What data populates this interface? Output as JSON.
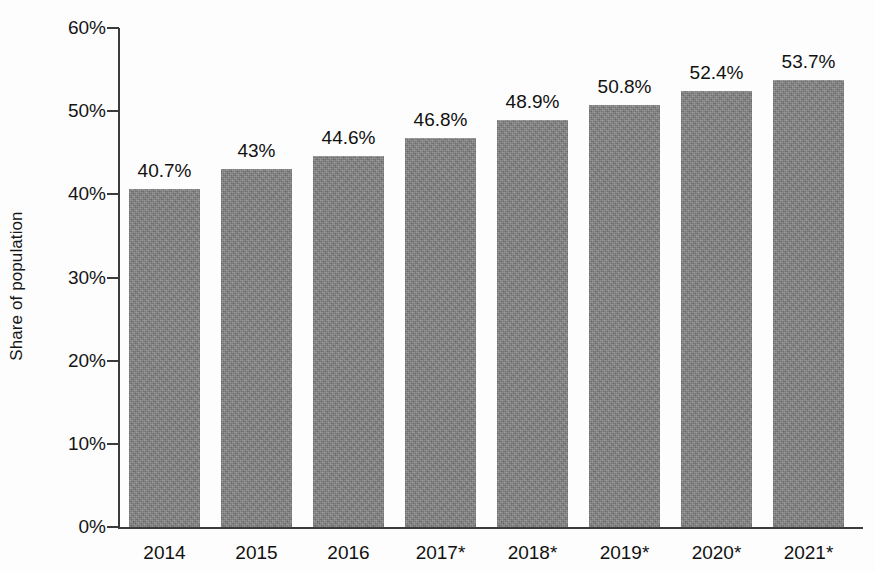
{
  "chart_data": {
    "type": "bar",
    "title": "",
    "subtitle": "",
    "xlabel": "",
    "ylabel": "Share of population",
    "categories": [
      "2014",
      "2015",
      "2016",
      "2017*",
      "2018*",
      "2019*",
      "2020*",
      "2021*"
    ],
    "values": [
      40.7,
      43.0,
      44.6,
      46.8,
      48.9,
      50.8,
      52.4,
      53.7
    ],
    "value_labels": [
      "40.7%",
      "43%",
      "44.6%",
      "46.8%",
      "48.9%",
      "50.8%",
      "52.4%",
      "53.7%"
    ],
    "ylim": [
      0,
      60
    ],
    "y_ticks": [
      0,
      10,
      20,
      30,
      40,
      50,
      60
    ],
    "y_tick_labels": [
      "0%",
      "10%",
      "20%",
      "30%",
      "40%",
      "50%",
      "60%"
    ],
    "grid": false,
    "legend": null,
    "series": [
      {
        "name": "Share of population",
        "values": [
          40.7,
          43.0,
          44.6,
          46.8,
          48.9,
          50.8,
          52.4,
          53.7
        ]
      }
    ],
    "bar_color": "#848484",
    "axis_color": "#3b3b3b",
    "text_color": "#111111",
    "background_color": "#fdfdfd"
  },
  "axis": {
    "y_title": "Share of population"
  },
  "footnote": {
    "edge_artifact": ""
  }
}
